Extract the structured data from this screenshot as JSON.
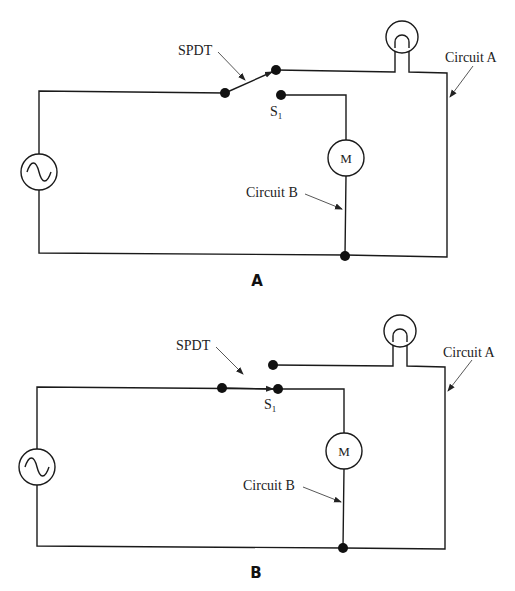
{
  "figure": {
    "panels": [
      {
        "id": "A",
        "label": "A",
        "switch_label": "SPDT",
        "switch_terminal_label": "S",
        "switch_terminal_subscript": "1",
        "switch_position": "upper contact (Circuit A, lamp)",
        "circuit_a_label": "Circuit A",
        "circuit_b_label": "Circuit B",
        "motor_label": "M"
      },
      {
        "id": "B",
        "label": "B",
        "switch_label": "SPDT",
        "switch_terminal_label": "S",
        "switch_terminal_subscript": "1",
        "switch_position": "lower contact (Circuit B, motor)",
        "circuit_a_label": "Circuit A",
        "circuit_b_label": "Circuit B",
        "motor_label": "M"
      }
    ],
    "components": [
      "AC source",
      "SPDT switch",
      "lamp",
      "motor"
    ]
  }
}
